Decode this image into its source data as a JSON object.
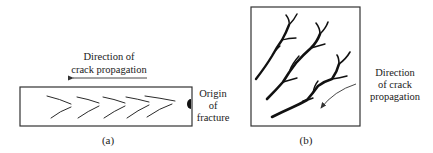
{
  "panel_a": {
    "caption": "(a)",
    "direction_label": [
      "Direction of",
      "crack propagation"
    ],
    "origin_label": [
      "Origin",
      "of",
      "fracture"
    ],
    "chevron_count": 5
  },
  "panel_b": {
    "caption": "(b)",
    "direction_label": [
      "Direction",
      "of crack",
      "propagation"
    ],
    "crack_count": 3
  }
}
